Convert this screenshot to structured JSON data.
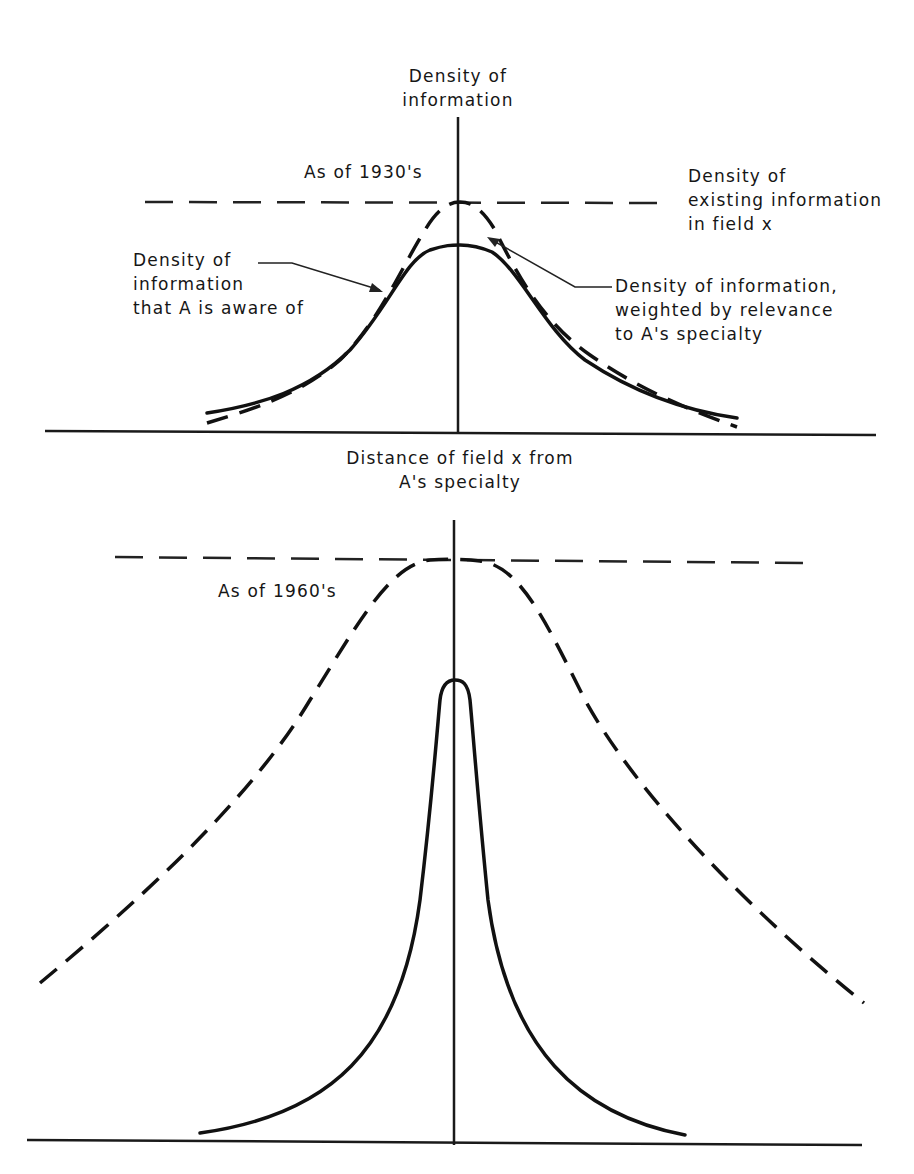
{
  "figure": {
    "top_panel": {
      "period_label": "As of 1930's",
      "y_axis_label": [
        "Density of",
        "information"
      ],
      "x_axis_label": [
        "Distance of field x from",
        "A's specialty"
      ],
      "existing_label": [
        "Density of",
        "existing information",
        "in field x"
      ],
      "aware_label": [
        "Density of",
        "information",
        "that A is aware of"
      ],
      "weighted_label": [
        "Density of information,",
        "weighted by relevance",
        "to A's specialty"
      ]
    },
    "bottom_panel": {
      "period_label": "As of 1960's"
    },
    "legend": {
      "dashed_reference_line": "Density of existing information in field x",
      "solid_curve": "Density of information that A is aware of",
      "dashed_curve": "Density of information, weighted by relevance to A's specialty"
    },
    "colors": {
      "ink": "#111111",
      "background": "#ffffff"
    }
  }
}
